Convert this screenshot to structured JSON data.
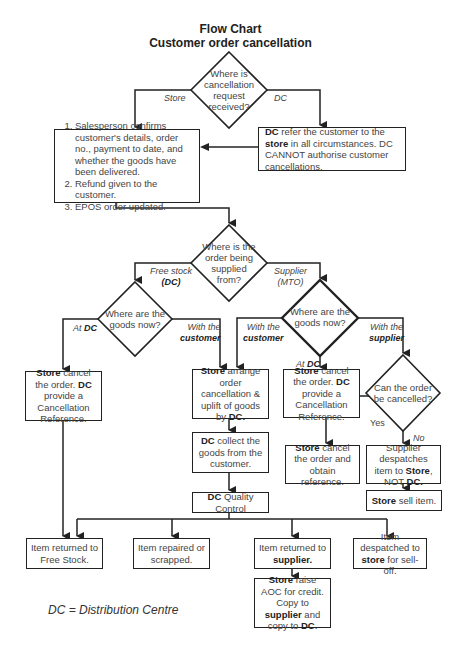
{
  "header": {
    "title": "Flow Chart",
    "subtitle": "Customer order cancellation"
  },
  "decisions": {
    "where_received": "Where is cancellation request received?",
    "where_supplied": "Where is the order being supplied from?",
    "goods_now_free_stock": "Where are the goods now?",
    "goods_now_supplier": "Where are the goods now?",
    "can_cancel": "Can the order be cancelled?"
  },
  "branch_labels": {
    "store": "Store",
    "dc": "DC",
    "free_stock": "Free stock",
    "free_stock_dc": "(DC)",
    "supplier": "Supplier",
    "supplier_mto": "(MTO)",
    "at": "At",
    "at_dc": "DC",
    "with_the": "With the",
    "customer": "customer",
    "supplier_lower": "supplier",
    "yes": "Yes",
    "no": "No"
  },
  "boxes": {
    "store_steps": {
      "step1": "Salesperson confirms customer's details, order no., payment to date, and whether the goods have been delivered.",
      "step2": "Refund given to the customer.",
      "step3": "EPOS order updated."
    },
    "dc_refer": {
      "b1": "DC",
      "t1": " refer the customer to the ",
      "b2": "store",
      "t2": " in all circumstances. DC CANNOT authorise customer cancellations."
    },
    "store_cancel_left": {
      "b1": "Store",
      "t1": " cancel the order. ",
      "b2": "DC",
      "t2": " provide a Cancellation Reference."
    },
    "store_arrange": {
      "b1": "Store",
      "t1": " arrange order cancellation & uplift of goods by ",
      "b2": "DC."
    },
    "store_cancel_right": {
      "b1": "Store",
      "t1": " cancel the order. ",
      "b2": "DC",
      "t2": " provide a Cancellation Reference."
    },
    "dc_collect": {
      "b1": "DC",
      "t1": " collect the goods from the customer."
    },
    "store_cancel_obtain": {
      "b1": "Store",
      "t1": " cancel the order and obtain reference."
    },
    "supplier_despatches": {
      "t1": "Supplier despatches item to ",
      "b1": "Store",
      "t2": ", NOT ",
      "b2": "DC."
    },
    "dc_qc": {
      "b1": "DC",
      "t1": " Quality Control"
    },
    "store_sell": {
      "b1": "Store",
      "t1": " sell item."
    },
    "returned_free_stock": {
      "t1": "Item returned to Free Stock."
    },
    "repaired_scrapped": {
      "t1": "Item repaired or scrapped."
    },
    "returned_supplier": {
      "t1": "Item returned to ",
      "b1": "supplier."
    },
    "despatched_store": {
      "t1": "Item despatched to ",
      "b1": "store",
      "t2": " for sell-off."
    },
    "store_aoc": {
      "b1": "Store",
      "t1": " raise AOC for credit. Copy to ",
      "b2": "supplier",
      "t2": " and copy to ",
      "b3": "DC",
      "t3": "."
    }
  },
  "legend": "DC = Distribution Centre",
  "colors": {
    "line": "#222222",
    "text": "#444444",
    "background": "#ffffff"
  }
}
